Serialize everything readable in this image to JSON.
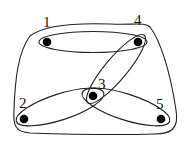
{
  "diagram": {
    "type": "hypergraph",
    "colors": {
      "stroke": "#222222",
      "node": "#000000",
      "label": "#111111",
      "background": "#ffffff"
    },
    "nodes": [
      {
        "id": "1",
        "label": "1",
        "x": 47,
        "y": 42,
        "label_x": 43,
        "label_y": 27
      },
      {
        "id": "2",
        "label": "2",
        "x": 24,
        "y": 119,
        "label_x": 19,
        "label_y": 108
      },
      {
        "id": "3",
        "label": "3",
        "x": 93,
        "y": 96,
        "label_x": 98,
        "label_y": 89
      },
      {
        "id": "4",
        "label": "4",
        "x": 138,
        "y": 42,
        "label_x": 134,
        "label_y": 25
      },
      {
        "id": "5",
        "label": "5",
        "x": 161,
        "y": 119,
        "label_x": 156,
        "label_y": 109
      }
    ],
    "hyperedges": [
      {
        "id": "e-all",
        "members": [
          "1",
          "2",
          "3",
          "4",
          "5"
        ]
      },
      {
        "id": "e-1-4",
        "members": [
          "1",
          "4"
        ]
      },
      {
        "id": "e-3-4",
        "members": [
          "3",
          "4"
        ]
      },
      {
        "id": "e-2-3",
        "members": [
          "2",
          "3"
        ]
      },
      {
        "id": "e-3-5",
        "members": [
          "3",
          "5"
        ]
      }
    ]
  }
}
